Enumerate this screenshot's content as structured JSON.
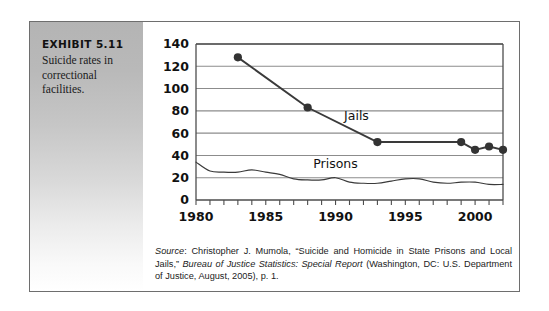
{
  "exhibit": {
    "title": "EXHIBIT 5.11",
    "description": "Suicide rates in correctional facilities."
  },
  "source": {
    "label": "Source",
    "part1": ": Christopher J. Mumola, “Suicide and Homicide in State Prisons and Local Jails,” ",
    "italic1": "Bureau of Justice Statistics: Special Report",
    "part2": " (Washington, DC: U.S. Department of Justice, August, 2005), p. 1."
  },
  "colors": {
    "frame_border": "#6e6e6e",
    "gridline": "#8c8c8c",
    "axis": "#4d4d4d",
    "jails_line": "#3a3a3a",
    "prisons_line": "#3a3a3a",
    "panel_top": "#b4b4b4",
    "panel_bottom": "#ffffff"
  },
  "chart_data": {
    "type": "line",
    "title": "",
    "xlabel": "",
    "ylabel": "",
    "xlim": [
      1980,
      2002
    ],
    "ylim": [
      0,
      140
    ],
    "yticks": [
      0,
      20,
      40,
      60,
      80,
      100,
      120,
      140
    ],
    "xticks_labeled": [
      1980,
      1985,
      1990,
      1995,
      2000
    ],
    "xticks_minor_every": 1,
    "grid": "horizontal",
    "legend": "inline-annotations",
    "annotations": [
      {
        "text": "Jails",
        "x": 1991.5,
        "y": 72
      },
      {
        "text": "Prisons",
        "x": 1990.0,
        "y": 29
      }
    ],
    "series": [
      {
        "name": "Jails",
        "markers": true,
        "x": [
          1983,
          1988,
          1993,
          1999,
          2000,
          2001,
          2002
        ],
        "values": [
          128,
          83,
          52,
          52,
          45,
          48,
          45
        ]
      },
      {
        "name": "Prisons",
        "markers": false,
        "x": [
          1980,
          1981,
          1982,
          1983,
          1984,
          1985,
          1986,
          1987,
          1988,
          1989,
          1990,
          1991,
          1992,
          1993,
          1994,
          1995,
          1996,
          1997,
          1998,
          1999,
          2000,
          2001,
          2002
        ],
        "values": [
          34,
          26,
          25,
          25,
          27,
          25,
          23,
          19,
          18,
          18,
          20,
          16,
          15,
          15,
          17,
          19,
          19,
          16,
          15,
          16,
          16,
          14,
          14
        ]
      }
    ]
  }
}
